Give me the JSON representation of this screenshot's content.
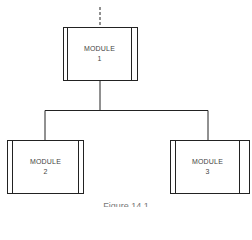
{
  "diagram": {
    "type": "hierarchy-chart",
    "top_text_partial": "...",
    "nodes": [
      {
        "id": "module-1",
        "label": "MODULE",
        "number": "1"
      },
      {
        "id": "module-2",
        "label": "MODULE",
        "number": "2"
      },
      {
        "id": "module-3",
        "label": "MODULE",
        "number": "3"
      }
    ],
    "edges": [
      {
        "from": "above",
        "to": "module-1",
        "style": "dashed"
      },
      {
        "from": "module-1",
        "to": "module-2"
      },
      {
        "from": "module-1",
        "to": "module-3"
      }
    ],
    "caption": "Figure 14.1",
    "colors": {
      "line": "#222222",
      "background": "#ffffff"
    }
  }
}
